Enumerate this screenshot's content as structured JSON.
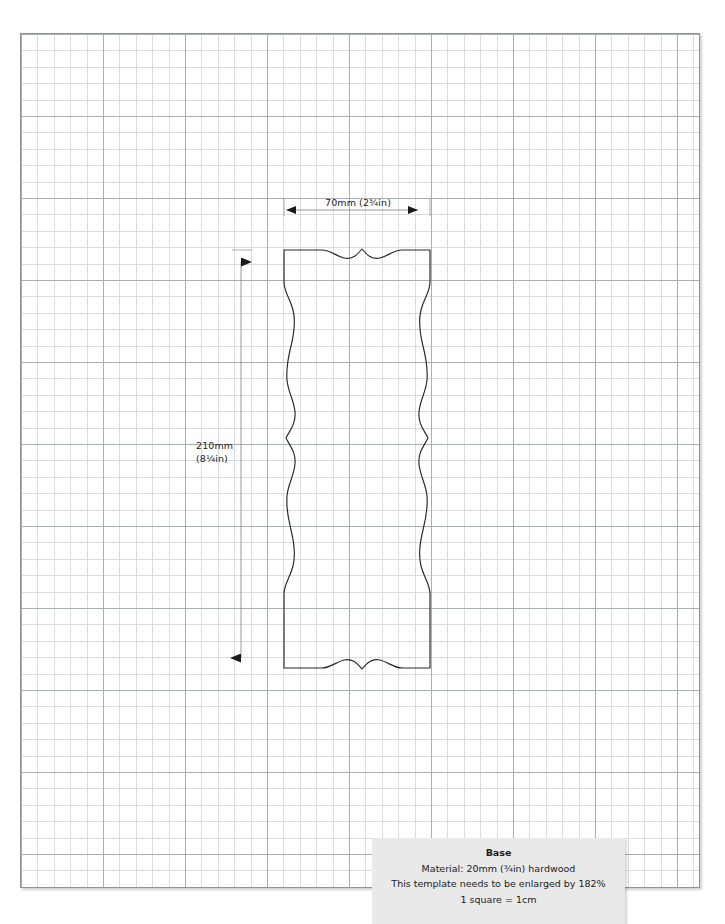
{
  "page": {
    "sheet_label": "graph-paper-sheet",
    "grid_minor_color": "#d9dde0",
    "grid_major_color": "#a9aeb2",
    "border_color": "#8f9396",
    "background": "#ffffff",
    "squares_across": 41,
    "squares_down": 52
  },
  "drawing": {
    "title": "Base",
    "line_color": "#262626",
    "outline_name": "base-template-outline",
    "description": "Wavy-sided woodworking base template with scalloped top and bottom edges"
  },
  "dimensions": {
    "width": {
      "label": "70mm (2¾in)",
      "value_mm": 70,
      "value_in": "2¾",
      "orientation": "horizontal"
    },
    "height": {
      "label_line1": "210mm",
      "label_line2": "(8¼in)",
      "value_mm": 210,
      "value_in": "8¼",
      "orientation": "vertical"
    }
  },
  "caption": {
    "title": "Base",
    "material": "Material:  20mm (¾in) hardwood",
    "enlargement": "This template needs to be enlarged by 182%",
    "scale": "1 square = 1cm",
    "background": "#e9e9e9"
  }
}
